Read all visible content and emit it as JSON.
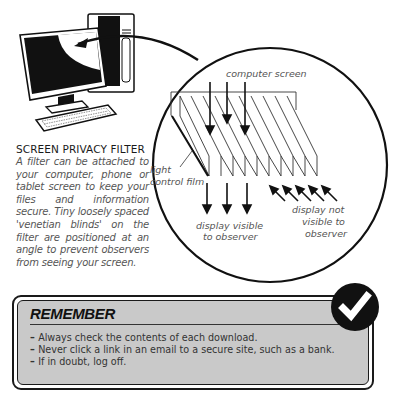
{
  "illustration": {
    "labels": {
      "computer_screen": "computer screen",
      "light_control_film_line1": "light",
      "light_control_film_line2": "control film",
      "visible_line1": "display visible",
      "visible_line2": "to observer",
      "not_visible_line1": "display not",
      "not_visible_line2": "visible to",
      "not_visible_line3": "observer"
    }
  },
  "caption": {
    "title": "SCREEN PRIVACY FILTER",
    "body": "A filter can be attached to your computer, phone or tablet screen to keep your files and information secure. Tiny loosely spaced 'venetian blinds' on the filter are positioned at an angle to prevent observers from seeing your screen."
  },
  "remember": {
    "title": "REMEMBER",
    "items": [
      "Always check the contents of each download.",
      "Never click a link in an email to a secure site, such as a bank.",
      "If in doubt, log off."
    ],
    "badge_icon": "checkmark-icon"
  },
  "colors": {
    "box_fill": "#c9c9c9",
    "ink": "#111111",
    "caption_text": "#555555"
  }
}
